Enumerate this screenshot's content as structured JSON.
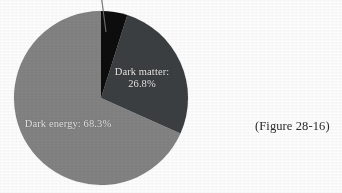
{
  "figure": {
    "caption": "(Figure 28-16)",
    "background_color": "#fefefe"
  },
  "chart_data": {
    "type": "pie",
    "title": "",
    "xlabel": "",
    "ylabel": "",
    "legend_position": "none",
    "grid": false,
    "start_angle_deg": -90,
    "direction": "clockwise",
    "center": {
      "x": 101,
      "y": 98
    },
    "radius": 87,
    "categories": [
      "Ordinary matter",
      "Dark matter",
      "Dark energy"
    ],
    "values": [
      4.9,
      26.8,
      68.3
    ],
    "labels": [
      "",
      "Dark matter:\n26.8%",
      "Dark energy: 68.3%"
    ],
    "colors": [
      "#0d0d0d",
      "#3c3f41",
      "#838383"
    ],
    "slices": [
      {
        "name": "Ordinary matter",
        "value": 4.9,
        "color": "#0d0d0d",
        "label_text": "",
        "label_visible": false,
        "has_leader_line": true,
        "leader_line_color": "#4a4a4a"
      },
      {
        "name": "Dark matter",
        "value": 26.8,
        "color": "#3c3f41",
        "label_line1": "Dark matter:",
        "label_line2": "26.8%",
        "label_visible": true,
        "label_color": "#e9e9e9",
        "has_leader_line": false
      },
      {
        "name": "Dark energy",
        "value": 68.3,
        "color": "#838383",
        "label_text": "Dark energy: 68.3%",
        "label_visible": true,
        "label_color": "#e9e9e9",
        "has_leader_line": false
      }
    ]
  }
}
